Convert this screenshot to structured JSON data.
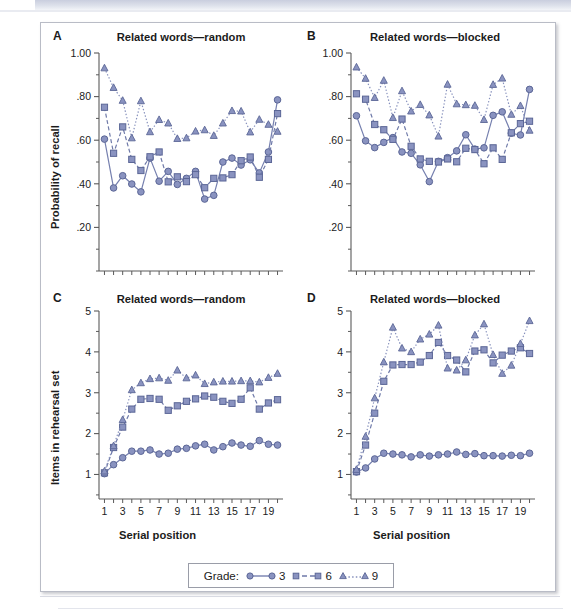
{
  "figure": {
    "panels": [
      {
        "letter": "A",
        "title": "Related words—random",
        "ylabel": "Probability of recall",
        "xlabel": ""
      },
      {
        "letter": "B",
        "title": "Related words—blocked",
        "ylabel": "",
        "xlabel": ""
      },
      {
        "letter": "C",
        "title": "Related words—random",
        "ylabel": "Items in rehearsal set",
        "xlabel": "Serial position"
      },
      {
        "letter": "D",
        "title": "Related words—blocked",
        "ylabel": "",
        "xlabel": "Serial position"
      }
    ]
  },
  "legend": {
    "title": "Grade:",
    "items": [
      {
        "label": "3",
        "marker": "circle-marker",
        "line": "solid",
        "color": "#7680af"
      },
      {
        "label": "6",
        "marker": "square-marker",
        "line": "dashed",
        "color": "#6f7aa9"
      },
      {
        "label": "9",
        "marker": "triangle-marker",
        "line": "dotted",
        "color": "#8690bc"
      }
    ]
  },
  "chart_data": [
    {
      "type": "line",
      "panel": "A",
      "title": "Related words—random",
      "xlabel": "",
      "ylabel": "Probability of recall",
      "x": [
        1,
        2,
        3,
        4,
        5,
        6,
        7,
        8,
        9,
        10,
        11,
        12,
        13,
        14,
        15,
        16,
        17,
        18,
        19,
        20
      ],
      "xlim": [
        0.4,
        20.6
      ],
      "ylim": [
        0.0,
        1.0
      ],
      "yticks": [
        0.2,
        0.4,
        0.6,
        0.8,
        1.0
      ],
      "ytick_labels": [
        ".20",
        ".40",
        ".60",
        ".80",
        "1.00"
      ],
      "xticks": [
        1,
        2,
        3,
        4,
        5,
        6,
        7,
        8,
        9,
        10,
        11,
        12,
        13,
        14,
        15,
        16,
        17,
        18,
        19,
        20
      ],
      "xtick_labels": [
        "",
        "",
        "",
        "",
        "",
        "",
        "",
        "",
        "",
        "",
        "",
        "",
        "",
        "",
        "",
        "",
        "",
        "",
        "",
        ""
      ],
      "grid": false,
      "legend_position": "bottom-outside",
      "series": [
        {
          "name": "3",
          "marker": "circle",
          "line": "solid",
          "values": [
            0.605,
            0.381,
            0.437,
            0.399,
            0.363,
            0.518,
            0.412,
            0.457,
            0.397,
            0.425,
            0.457,
            0.33,
            0.347,
            0.5,
            0.518,
            0.486,
            0.51,
            0.45,
            0.546,
            0.785
          ]
        },
        {
          "name": "6",
          "marker": "square",
          "line": "dashed",
          "values": [
            0.751,
            0.54,
            0.661,
            0.512,
            0.461,
            0.524,
            0.546,
            0.409,
            0.432,
            0.41,
            0.442,
            0.382,
            0.425,
            0.427,
            0.442,
            0.506,
            0.523,
            0.43,
            0.512,
            0.722
          ]
        },
        {
          "name": "9",
          "marker": "triangle",
          "line": "dotted",
          "values": [
            0.931,
            0.841,
            0.782,
            0.61,
            0.78,
            0.638,
            0.694,
            0.678,
            0.607,
            0.61,
            0.641,
            0.647,
            0.621,
            0.678,
            0.735,
            0.733,
            0.637,
            0.695,
            0.672,
            0.64
          ]
        }
      ]
    },
    {
      "type": "line",
      "panel": "B",
      "title": "Related words—blocked",
      "xlabel": "",
      "ylabel": "",
      "x": [
        1,
        2,
        3,
        4,
        5,
        6,
        7,
        8,
        9,
        10,
        11,
        12,
        13,
        14,
        15,
        16,
        17,
        18,
        19,
        20
      ],
      "xlim": [
        0.4,
        20.6
      ],
      "ylim": [
        0.0,
        1.0
      ],
      "yticks": [
        0.2,
        0.4,
        0.6,
        0.8,
        1.0
      ],
      "ytick_labels": [
        ".20",
        ".40",
        ".60",
        ".80",
        "1.00"
      ],
      "xticks": [
        1,
        2,
        3,
        4,
        5,
        6,
        7,
        8,
        9,
        10,
        11,
        12,
        13,
        14,
        15,
        16,
        17,
        18,
        19,
        20
      ],
      "xtick_labels": [
        "",
        "",
        "",
        "",
        "",
        "",
        "",
        "",
        "",
        "",
        "",
        "",
        "",
        "",
        "",
        "",
        "",
        "",
        "",
        ""
      ],
      "grid": false,
      "legend_position": "bottom-outside",
      "series": [
        {
          "name": "3",
          "marker": "circle",
          "line": "solid",
          "values": [
            0.712,
            0.597,
            0.566,
            0.59,
            0.612,
            0.546,
            0.54,
            0.487,
            0.41,
            0.503,
            0.52,
            0.551,
            0.625,
            0.559,
            0.565,
            0.714,
            0.73,
            0.632,
            0.624,
            0.833
          ]
        },
        {
          "name": "6",
          "marker": "square",
          "line": "dashed",
          "values": [
            0.813,
            0.788,
            0.672,
            0.648,
            0.604,
            0.697,
            0.572,
            0.514,
            0.503,
            0.5,
            0.514,
            0.501,
            0.563,
            0.557,
            0.492,
            0.565,
            0.512,
            0.634,
            0.676,
            0.687
          ]
        },
        {
          "name": "9",
          "marker": "triangle",
          "line": "dotted",
          "values": [
            0.935,
            0.883,
            0.795,
            0.874,
            0.703,
            0.826,
            0.733,
            0.763,
            0.715,
            0.618,
            0.856,
            0.766,
            0.762,
            0.759,
            0.694,
            0.855,
            0.884,
            0.718,
            0.758,
            0.645
          ]
        }
      ]
    },
    {
      "type": "line",
      "panel": "C",
      "title": "Related words—random",
      "xlabel": "Serial position",
      "ylabel": "Items in rehearsal set",
      "x": [
        1,
        2,
        3,
        4,
        5,
        6,
        7,
        8,
        9,
        10,
        11,
        12,
        13,
        14,
        15,
        16,
        17,
        18,
        19,
        20
      ],
      "xlim": [
        0.4,
        20.6
      ],
      "ylim": [
        0.4,
        5.0
      ],
      "yticks": [
        1,
        2,
        3,
        4,
        5
      ],
      "ytick_labels": [
        "1",
        "2",
        "3",
        "4",
        "5"
      ],
      "xticks": [
        1,
        2,
        3,
        4,
        5,
        6,
        7,
        8,
        9,
        10,
        11,
        12,
        13,
        14,
        15,
        16,
        17,
        18,
        19,
        20
      ],
      "xtick_labels": [
        "1",
        "",
        "3",
        "",
        "5",
        "",
        "7",
        "",
        "9",
        "",
        "11",
        "",
        "13",
        "",
        "15",
        "",
        "17",
        "",
        "19",
        ""
      ],
      "grid": false,
      "legend_position": "bottom-outside",
      "series": [
        {
          "name": "3",
          "marker": "circle",
          "line": "solid",
          "values": [
            1.02,
            1.24,
            1.41,
            1.57,
            1.57,
            1.6,
            1.5,
            1.52,
            1.62,
            1.64,
            1.7,
            1.74,
            1.6,
            1.68,
            1.77,
            1.72,
            1.69,
            1.83,
            1.74,
            1.72
          ]
        },
        {
          "name": "6",
          "marker": "square",
          "line": "dashed",
          "values": [
            1.04,
            1.66,
            2.16,
            2.6,
            2.84,
            2.86,
            2.84,
            2.57,
            2.68,
            2.79,
            2.85,
            2.92,
            2.89,
            2.79,
            2.74,
            2.84,
            3.12,
            2.6,
            2.75,
            2.83
          ]
        },
        {
          "name": "9",
          "marker": "triangle",
          "line": "dotted",
          "values": [
            1.08,
            1.7,
            2.34,
            3.07,
            3.24,
            3.34,
            3.36,
            3.3,
            3.55,
            3.36,
            3.43,
            3.22,
            3.26,
            3.28,
            3.28,
            3.29,
            3.29,
            3.26,
            3.37,
            3.47
          ]
        }
      ]
    },
    {
      "type": "line",
      "panel": "D",
      "title": "Related words—blocked",
      "xlabel": "Serial position",
      "ylabel": "",
      "x": [
        1,
        2,
        3,
        4,
        5,
        6,
        7,
        8,
        9,
        10,
        11,
        12,
        13,
        14,
        15,
        16,
        17,
        18,
        19,
        20
      ],
      "xlim": [
        0.4,
        20.6
      ],
      "ylim": [
        0.4,
        5.0
      ],
      "yticks": [
        1,
        2,
        3,
        4,
        5
      ],
      "ytick_labels": [
        "1",
        "2",
        "3",
        "4",
        "5"
      ],
      "xticks": [
        1,
        2,
        3,
        4,
        5,
        6,
        7,
        8,
        9,
        10,
        11,
        12,
        13,
        14,
        15,
        16,
        17,
        18,
        19,
        20
      ],
      "xtick_labels": [
        "1",
        "",
        "3",
        "",
        "5",
        "",
        "7",
        "",
        "9",
        "",
        "11",
        "",
        "13",
        "",
        "15",
        "",
        "17",
        "",
        "19",
        ""
      ],
      "grid": false,
      "legend_position": "bottom-outside",
      "series": [
        {
          "name": "3",
          "marker": "circle",
          "line": "solid",
          "values": [
            1.06,
            1.16,
            1.38,
            1.52,
            1.5,
            1.48,
            1.43,
            1.48,
            1.45,
            1.48,
            1.5,
            1.55,
            1.49,
            1.51,
            1.46,
            1.46,
            1.45,
            1.47,
            1.46,
            1.52
          ]
        },
        {
          "name": "6",
          "marker": "square",
          "line": "dashed",
          "values": [
            1.07,
            1.72,
            2.5,
            3.28,
            3.68,
            3.69,
            3.69,
            3.75,
            3.91,
            4.23,
            3.91,
            3.8,
            3.51,
            4.02,
            4.05,
            3.73,
            3.92,
            4.02,
            4.1,
            3.96
          ]
        },
        {
          "name": "9",
          "marker": "triangle",
          "line": "dotted",
          "values": [
            1.12,
            1.93,
            2.87,
            3.75,
            4.6,
            4.09,
            4.0,
            4.31,
            4.43,
            4.65,
            3.6,
            3.55,
            3.8,
            4.41,
            4.68,
            3.93,
            3.47,
            3.67,
            4.2,
            4.76
          ]
        }
      ]
    }
  ]
}
